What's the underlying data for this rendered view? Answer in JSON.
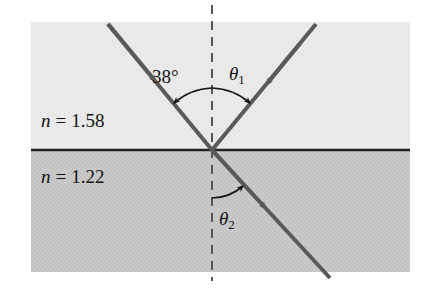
{
  "figure": {
    "colors": {
      "upper_medium_fill": "#ebebeb",
      "lower_medium_fill": "#c9c9c9",
      "ray_color": "#5a5a5a",
      "boundary_color": "#222222",
      "normal_color": "#555555",
      "text_color": "#141414"
    },
    "media": [
      {
        "position": "upper",
        "label_prefix": "n",
        "label_equals": "=",
        "index_value": "1.58",
        "label_full": "n = 1.58"
      },
      {
        "position": "lower",
        "label_prefix": "n",
        "label_equals": "=",
        "index_value": "1.22",
        "label_full": "n = 1.22"
      }
    ],
    "angles": [
      {
        "id": "incident",
        "label": "38°",
        "symbol": "38",
        "unit": "°",
        "subscript": "",
        "side": "left",
        "region": "upper",
        "value_degrees": 38
      },
      {
        "id": "reflected",
        "label": "θ₁",
        "symbol": "θ",
        "unit": "",
        "subscript": "1",
        "side": "right",
        "region": "upper",
        "value_degrees": 38
      },
      {
        "id": "refracted",
        "label": "θ₂",
        "symbol": "θ",
        "unit": "",
        "subscript": "2",
        "side": "right",
        "region": "lower",
        "value_degrees": 30
      }
    ],
    "rays": [
      {
        "id": "incident-ray",
        "name": "incident-ray",
        "from": "upper-left",
        "to": "vertex",
        "arrow_direction": "down-right"
      },
      {
        "id": "reflected-ray",
        "name": "reflected-ray",
        "from": "upper-right",
        "to": "vertex",
        "arrow_direction": "down-left"
      },
      {
        "id": "refracted-ray",
        "name": "refracted-ray",
        "from": "vertex",
        "to": "lower-right",
        "arrow_direction": "down-right"
      }
    ],
    "normal_line": {
      "style": "dashed",
      "orientation": "vertical"
    },
    "boundary_line": {
      "style": "solid",
      "orientation": "horizontal"
    }
  }
}
